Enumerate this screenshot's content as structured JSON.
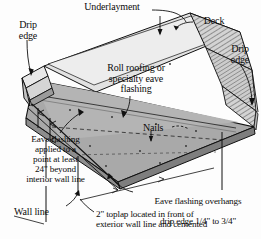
{
  "figure": {
    "colors": {
      "roof_fill": "#a9a9a9",
      "roof_light": "#d8d8d8",
      "deck_edge": "#cfcfcf",
      "line": "#111111",
      "background": "#fdfdfd"
    }
  },
  "labels": {
    "underlayment": "Underlayment",
    "deck": "Deck",
    "drip_edge_left": "Drip\nedge",
    "drip_edge_right": "Drip\nedge",
    "roll_roofing": "Roll roofing or\nspecialty eave\nflashing",
    "nails": "Nails",
    "eave_flashing_applied": "Eave flashing\napplied to a\npoint at least\n24\" beyond\ninterior wall line",
    "wall_line": "Wall line",
    "eave_overhang_line1": "Eave flashing overhangs",
    "eave_overhang_line2_pre": "drip edge ",
    "eave_overhang_frac1": "1/4\"",
    "eave_overhang_mid": " to ",
    "eave_overhang_frac2": "3/4\"",
    "toplap": "2\" toplap located in front of\nexterior wall line and cemented"
  }
}
